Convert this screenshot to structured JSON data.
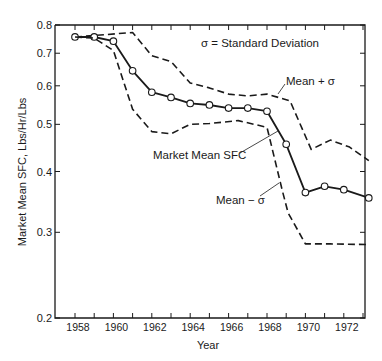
{
  "chart_data": {
    "type": "line",
    "title": "",
    "xlabel": "Year",
    "ylabel": "Market Mean SFC, Lbs/Hr/Lbs",
    "yscale": "log",
    "ylim": [
      0.2,
      0.8
    ],
    "xlim": [
      1957.9,
      1973.5
    ],
    "yticks": [
      0.2,
      0.3,
      0.4,
      0.5,
      0.6,
      0.7,
      0.8
    ],
    "ytick_labels": [
      "0.2",
      "0.3",
      "0.4",
      "0.5",
      "0.6",
      "0.7",
      "0.8"
    ],
    "xticks": [
      1958,
      1959,
      1960,
      1961,
      1962,
      1963,
      1964,
      1965,
      1966,
      1967,
      1968,
      1969,
      1970,
      1971,
      1972,
      1973
    ],
    "xtick_labels": [
      "1958",
      "",
      "1960",
      "",
      "1962",
      "",
      "1964",
      "",
      "1966",
      "",
      "1968",
      "",
      "1970",
      "",
      "1972",
      ""
    ],
    "grid": false,
    "annotation": "σ = Standard Deviation",
    "series": [
      {
        "name": "Mean + σ",
        "style": "dashed",
        "markers": false,
        "x": [
          1958,
          1961,
          1962,
          1963,
          1964,
          1965,
          1966,
          1967,
          1968,
          1969.2,
          1970.3,
          1971.3,
          1972.3,
          1973.3
        ],
        "values": [
          0.756,
          0.772,
          0.692,
          0.673,
          0.608,
          0.594,
          0.577,
          0.572,
          0.577,
          0.559,
          0.444,
          0.464,
          0.449,
          0.421
        ]
      },
      {
        "name": "Market Mean SFC",
        "style": "solid",
        "markers": true,
        "x": [
          1958,
          1959,
          1960,
          1961,
          1962,
          1963,
          1964,
          1965,
          1966,
          1967,
          1968,
          1969,
          1970,
          1971,
          1972,
          1973.3
        ],
        "values": [
          0.756,
          0.756,
          0.741,
          0.644,
          0.582,
          0.568,
          0.552,
          0.548,
          0.54,
          0.54,
          0.532,
          0.455,
          0.362,
          0.373,
          0.367,
          0.353
        ]
      },
      {
        "name": "Mean − σ",
        "style": "dashed",
        "markers": false,
        "x": [
          1958,
          1959,
          1960,
          1961,
          1962,
          1963,
          1964,
          1965,
          1966.5,
          1968,
          1968.8,
          1969.1,
          1970,
          1971.3,
          1973.3
        ],
        "values": [
          0.756,
          0.752,
          0.709,
          0.537,
          0.483,
          0.478,
          0.5,
          0.502,
          0.509,
          0.493,
          0.365,
          0.329,
          0.284,
          0.284,
          0.283
        ]
      }
    ],
    "labels": [
      {
        "text": "Mean + σ",
        "for": "Mean + σ"
      },
      {
        "text": "Market Mean SFC",
        "for": "Market Mean SFC"
      },
      {
        "text": "Mean − σ",
        "for": "Mean − σ"
      }
    ]
  },
  "labels": {
    "legend_note": "σ = Standard Deviation",
    "mean_plus": "Mean + σ",
    "mean": "Market Mean SFC",
    "mean_minus": "Mean − σ",
    "xlabel": "Year",
    "ylabel": "Market Mean SFC, Lbs/Hr/Lbs"
  }
}
